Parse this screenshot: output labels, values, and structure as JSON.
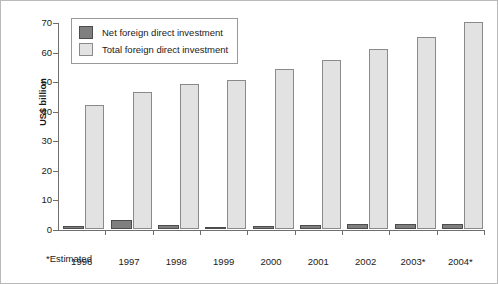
{
  "chart_data": {
    "type": "bar",
    "title": "",
    "subtitle": "",
    "xlabel": "",
    "ylabel": "US$ billion",
    "categories": [
      "1996",
      "1997",
      "1998",
      "1999",
      "2000",
      "2001",
      "2002",
      "2003*",
      "2004*"
    ],
    "series": [
      {
        "name": "Net foreign direct investment",
        "color": "#7f7f7f",
        "values": [
          1.0,
          3.0,
          1.5,
          0.3,
          1.0,
          1.3,
          1.7,
          1.8,
          1.8
        ]
      },
      {
        "name": "Total foreign direct investment",
        "color": "#e2e2e2",
        "values": [
          42.0,
          46.5,
          49.0,
          50.5,
          54.0,
          57.0,
          61.0,
          65.0,
          70.0
        ]
      }
    ],
    "ylim": [
      0,
      70
    ],
    "ytick_labels": [
      "0",
      "10",
      "20",
      "30",
      "40",
      "50",
      "60",
      "70"
    ],
    "ytick_values": [
      0,
      10,
      20,
      30,
      40,
      50,
      60,
      70
    ],
    "grid": false,
    "legend_position": "top-left",
    "annotations": [
      "*Estimated"
    ]
  },
  "legend": {
    "items": [
      {
        "label": "Net foreign direct investment",
        "swatch": "net-swatch"
      },
      {
        "label": "Total foreign direct investment",
        "swatch": "total-swatch"
      }
    ]
  },
  "footnote": "*Estimated"
}
